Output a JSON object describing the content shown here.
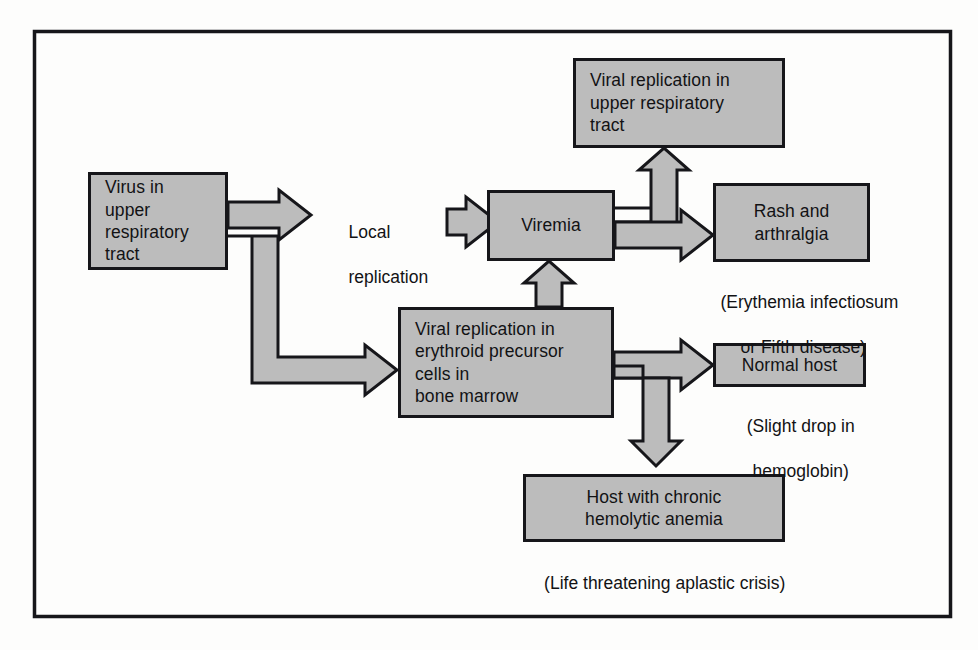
{
  "figure": {
    "type": "flowchart",
    "border_color": "#16161a",
    "node_fill": "#bcbcbc",
    "background": "#fdfdfc"
  },
  "nodes": {
    "virus_uri": {
      "id": "virus-in-upper-respiratory-tract",
      "lines": [
        "Virus in",
        "upper",
        "respiratory",
        "tract"
      ]
    },
    "viral_repl_uri": {
      "id": "viral-replication-upper-respiratory-tract",
      "lines": [
        "Viral replication in",
        "upper respiratory",
        "tract"
      ]
    },
    "viremia": {
      "id": "viremia",
      "lines": [
        "Viremia"
      ]
    },
    "rash": {
      "id": "rash-and-arthralgia",
      "lines": [
        "Rash and",
        "arthralgia"
      ]
    },
    "bone_marrow": {
      "id": "viral-replication-erythroid-precursor-cells",
      "lines": [
        "Viral replication in",
        "erythroid precursor",
        "cells in",
        "bone marrow"
      ]
    },
    "normal_host": {
      "id": "normal-host",
      "lines": [
        "Normal host"
      ]
    },
    "chronic_host": {
      "id": "host-with-chronic-hemolytic-anemia",
      "lines": [
        "Host with chronic",
        "hemolytic anemia"
      ]
    }
  },
  "labels": {
    "local_replication": {
      "id": "local-replication-label",
      "lines": [
        "Local",
        "replication"
      ]
    },
    "rash_note": {
      "id": "erythemia-infectiosum-note",
      "lines": [
        "(Erythemia infectiosum",
        "or Fifth disease)"
      ]
    },
    "normal_host_note": {
      "id": "slight-drop-hemoglobin-note",
      "lines": [
        "(Slight drop in",
        "hemoglobin)"
      ]
    },
    "chronic_host_note": {
      "id": "life-threatening-aplastic-crisis-note",
      "lines": [
        "(Life threatening aplastic crisis)"
      ]
    }
  },
  "edges": [
    {
      "id": "virus-to-local-replication",
      "from": "virus_uri",
      "to": "local_replication",
      "style": "block-arrow-right"
    },
    {
      "id": "virus-to-bone-marrow",
      "from": "virus_uri",
      "to": "bone_marrow",
      "style": "block-arrow-elbow-down-right"
    },
    {
      "id": "local-replication-to-viremia",
      "from": "local_replication",
      "to": "viremia",
      "style": "block-arrow-right"
    },
    {
      "id": "bone-marrow-to-viremia",
      "from": "bone_marrow",
      "to": "viremia",
      "style": "block-arrow-up"
    },
    {
      "id": "viremia-to-viral-replication-uri",
      "from": "viremia",
      "to": "viral_repl_uri",
      "style": "block-arrow-elbow-up"
    },
    {
      "id": "viremia-to-rash",
      "from": "viremia",
      "to": "rash",
      "style": "block-arrow-right"
    },
    {
      "id": "bone-marrow-to-normal-host",
      "from": "bone_marrow",
      "to": "normal_host",
      "style": "block-arrow-right"
    },
    {
      "id": "bone-marrow-to-chronic-host",
      "from": "bone_marrow",
      "to": "chronic_host",
      "style": "block-arrow-elbow-down"
    }
  ]
}
